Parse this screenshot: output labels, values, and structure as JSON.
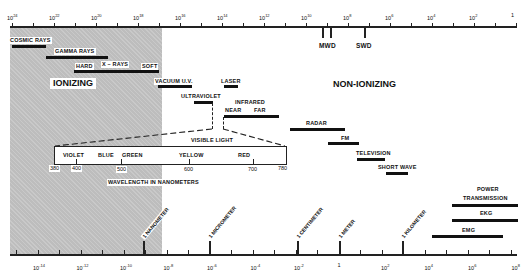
{
  "top_axis": {
    "title": "Frequency (Hz)",
    "ticks": [
      {
        "label_base": "10",
        "exp": "24",
        "x": 8
      },
      {
        "label_base": "10",
        "exp": "22",
        "x": 50
      },
      {
        "label_base": "10",
        "exp": "20",
        "x": 93
      },
      {
        "label_base": "10",
        "exp": "18",
        "x": 135
      },
      {
        "label_base": "10",
        "exp": "16",
        "x": 178
      },
      {
        "label_base": "10",
        "exp": "14",
        "x": 220
      },
      {
        "label_base": "10",
        "exp": "12",
        "x": 262
      },
      {
        "label_base": "10",
        "exp": "10",
        "x": 304
      },
      {
        "label_base": "10",
        "exp": "8",
        "x": 346
      },
      {
        "label_base": "10",
        "exp": "6",
        "x": 388
      },
      {
        "label_base": "10",
        "exp": "4",
        "x": 430
      },
      {
        "label_base": "10",
        "exp": "2",
        "x": 472
      },
      {
        "label_base": "1",
        "exp": "",
        "x": 516
      }
    ],
    "markers": [
      {
        "label": "MWD"
      },
      {
        "label": "SWD"
      }
    ]
  },
  "regions": {
    "ionizing": "IONIZING",
    "non_ionizing": "NON-IONIZING"
  },
  "bands": [
    {
      "label": "COSMIC RAYS"
    },
    {
      "label": "GAMMA RAYS"
    },
    {
      "label_left": "HARD",
      "label_mid": "X – RAYS",
      "label_right": "SOFT"
    },
    {
      "label": "VACUUM U.V."
    },
    {
      "label": "LASER"
    },
    {
      "label": "ULTRAVIOLET"
    },
    {
      "label": "INFRARED",
      "label_left": "NEAR",
      "label_right": "FAR"
    },
    {
      "label": "RADAR"
    },
    {
      "label": "FM"
    },
    {
      "label": "TELEVISION"
    },
    {
      "label": "SHORT WAVE"
    },
    {
      "label": "POWER",
      "label2": "TRANSMISSION"
    },
    {
      "label": "EKG"
    },
    {
      "label": "EMG"
    }
  ],
  "visible_light": {
    "title": "VISIBLE LIGHT",
    "colors": [
      "VIOLET",
      "BLUE",
      "GREEN",
      "YELLOW",
      "RED"
    ],
    "wavelengths": [
      "380",
      "400",
      "500",
      "600",
      "700",
      "780"
    ],
    "unit_label": "WAVELENGTH IN NANOMETERS"
  },
  "bottom_axis": {
    "title": "Wavelength (meters)",
    "ticks": [
      {
        "label_base": "10",
        "exp": "-14"
      },
      {
        "label_base": "10",
        "exp": "-12"
      },
      {
        "label_base": "10",
        "exp": "-10"
      },
      {
        "label_base": "10",
        "exp": "-8"
      },
      {
        "label_base": "10",
        "exp": "-6"
      },
      {
        "label_base": "10",
        "exp": "-4"
      },
      {
        "label_base": "10",
        "exp": "-2"
      },
      {
        "label_base": "1",
        "exp": ""
      },
      {
        "label_base": "10",
        "exp": "2"
      },
      {
        "label_base": "10",
        "exp": "4"
      },
      {
        "label_base": "10",
        "exp": "6"
      },
      {
        "label_base": "10",
        "exp": "8"
      }
    ],
    "reference_labels": [
      "1 NANOMETER",
      "1 MICROMETER",
      "1 CENTIMETER",
      "1 METER",
      "1 KILOMETER"
    ]
  }
}
